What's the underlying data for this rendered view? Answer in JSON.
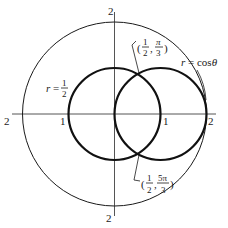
{
  "diagram": {
    "type": "polar-curves",
    "colors": {
      "stroke": "#1a1a1a",
      "axis": "#555555",
      "background": "#ffffff"
    },
    "axes": {
      "tick_labels": {
        "top": "2",
        "bottom": "2",
        "left": "2",
        "right": "2",
        "inner_left": "1",
        "inner_right": "1"
      }
    },
    "curves": [
      {
        "id": "circle-half",
        "equation": "r = 1/2",
        "label_lhs": "r =",
        "label_num": "1",
        "label_den": "2"
      },
      {
        "id": "circle-cos",
        "equation": "r = cos θ",
        "label": "r = cos θ"
      },
      {
        "id": "reference-circle",
        "equation": "r = 2"
      }
    ],
    "intersections": [
      {
        "id": "upper",
        "label": "(1/2, π/3)",
        "r_num": "1",
        "r_den": "2",
        "theta_num": "π",
        "theta_den": "3"
      },
      {
        "id": "lower",
        "label": "(1/2, 5π/3)",
        "r_num": "1",
        "r_den": "2",
        "theta_num": "5π",
        "theta_den": "3"
      }
    ]
  }
}
